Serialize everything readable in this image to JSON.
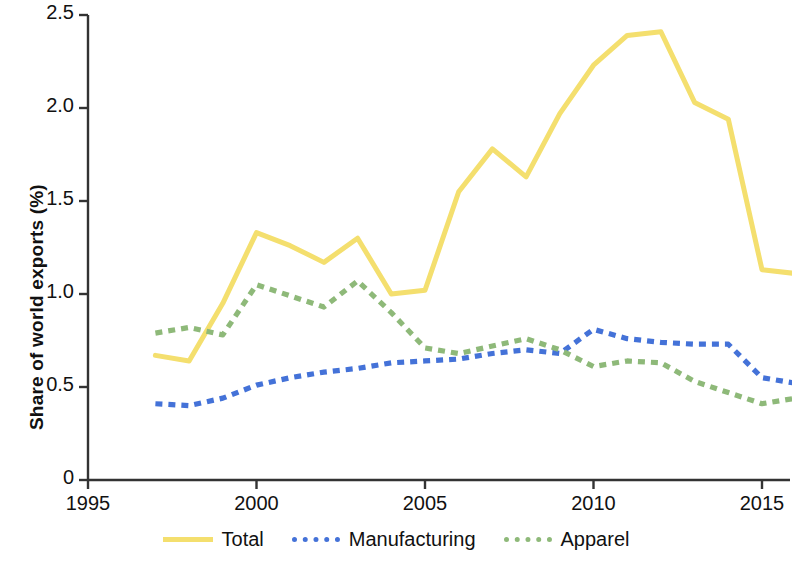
{
  "chart_data": {
    "type": "line",
    "title": "",
    "xlabel": "",
    "ylabel": "Share of world exports (%)",
    "xlim": [
      1995,
      2016.5
    ],
    "ylim": [
      0,
      2.5
    ],
    "grid": false,
    "legend_position": "bottom",
    "x": [
      1997,
      1998,
      1999,
      2000,
      2001,
      2002,
      2003,
      2004,
      2005,
      2006,
      2007,
      2008,
      2009,
      2010,
      2011,
      2012,
      2013,
      2014,
      2015,
      2016
    ],
    "series": [
      {
        "name": "Total",
        "color": "#F4DF6E",
        "style": "solid",
        "values": [
          0.67,
          0.64,
          0.95,
          1.33,
          1.26,
          1.17,
          1.3,
          1.0,
          1.02,
          1.55,
          1.78,
          1.63,
          1.97,
          2.23,
          2.39,
          2.41,
          2.03,
          1.94,
          1.13,
          1.11
        ]
      },
      {
        "name": "Manufacturing",
        "color": "#4472D8",
        "style": "dotted",
        "values": [
          0.41,
          0.4,
          0.44,
          0.51,
          0.55,
          0.58,
          0.6,
          0.63,
          0.64,
          0.65,
          0.68,
          0.7,
          0.68,
          0.81,
          0.76,
          0.74,
          0.73,
          0.73,
          0.55,
          0.52
        ]
      },
      {
        "name": "Apparel",
        "color": "#8EB979",
        "style": "dotted",
        "values": [
          0.79,
          0.82,
          0.78,
          1.05,
          0.99,
          0.93,
          1.07,
          0.9,
          0.71,
          0.68,
          0.72,
          0.76,
          0.7,
          0.61,
          0.64,
          0.63,
          0.53,
          0.47,
          0.41,
          0.44
        ]
      }
    ],
    "y_ticks": [
      {
        "value": 0,
        "label": "0"
      },
      {
        "value": 0.5,
        "label": "0.5"
      },
      {
        "value": 1.0,
        "label": "1.0"
      },
      {
        "value": 1.5,
        "label": "1.5"
      },
      {
        "value": 2.0,
        "label": "2.0"
      },
      {
        "value": 2.5,
        "label": "2.5"
      }
    ],
    "x_ticks": [
      {
        "value": 1995,
        "label": "1995"
      },
      {
        "value": 2000,
        "label": "2000"
      },
      {
        "value": 2005,
        "label": "2005"
      },
      {
        "value": 2010,
        "label": "2010"
      },
      {
        "value": 2015,
        "label": "2015"
      }
    ]
  },
  "legend": {
    "items": [
      {
        "label": "Total"
      },
      {
        "label": "Manufacturing"
      },
      {
        "label": "Apparel"
      }
    ]
  }
}
